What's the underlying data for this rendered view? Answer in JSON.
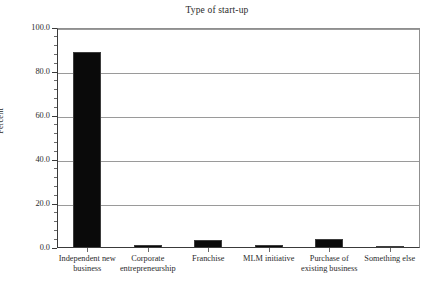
{
  "chart_data": {
    "type": "bar",
    "title": "Type of start-up",
    "xlabel": "",
    "ylabel": "Percent",
    "ylim": [
      0,
      100
    ],
    "ytick_step": 20,
    "yminor_step": 4,
    "grid": true,
    "legend": "none",
    "categories": [
      "Independent new business",
      "Corporate entrepreneurship",
      "Franchise",
      "MLM initiative",
      "Purchase of existing business",
      "Something else"
    ],
    "values": [
      89.0,
      1.2,
      3.6,
      1.5,
      4.1,
      0.5
    ],
    "ytick_labels": [
      "0.0",
      "20.0",
      "40.0",
      "60.0",
      "80.0",
      "100.0"
    ],
    "ytick_values": [
      0,
      20,
      40,
      60,
      80,
      100
    ],
    "bar_color": "#0a0a0a",
    "grid_color": "#9a9a9a",
    "axis_color": "#3a3a3a",
    "text_color": "#2b2b2b"
  },
  "categories_wrapped": [
    [
      "Independent new",
      "business"
    ],
    [
      "Corporate",
      "entrepreneurship"
    ],
    [
      "Franchise",
      ""
    ],
    [
      "MLM initiative",
      ""
    ],
    [
      "Purchase of",
      "existing business"
    ],
    [
      "Something else",
      ""
    ]
  ]
}
